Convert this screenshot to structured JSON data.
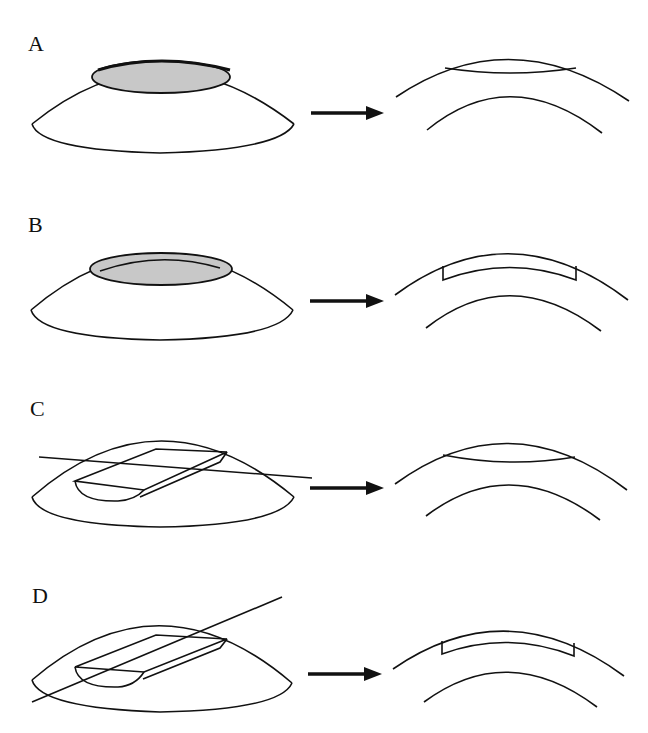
{
  "figure": {
    "panels": [
      {
        "label": "A",
        "description": "Dome with shaded surface ellipse; result: thin lens-shaped removal at surface"
      },
      {
        "label": "B",
        "description": "Dome with shaded ring/annular region; result: rectangular-ended inset layer"
      },
      {
        "label": "C",
        "description": "Dome with blade passing through surface cut plane; result: lens-shaped removal"
      },
      {
        "label": "D",
        "description": "Dome with diagonal blade cut; result: rectangular-ended inset layer"
      }
    ],
    "colors": {
      "stroke": "#111111",
      "shade": "#c8c8c8",
      "background": "#ffffff"
    }
  }
}
